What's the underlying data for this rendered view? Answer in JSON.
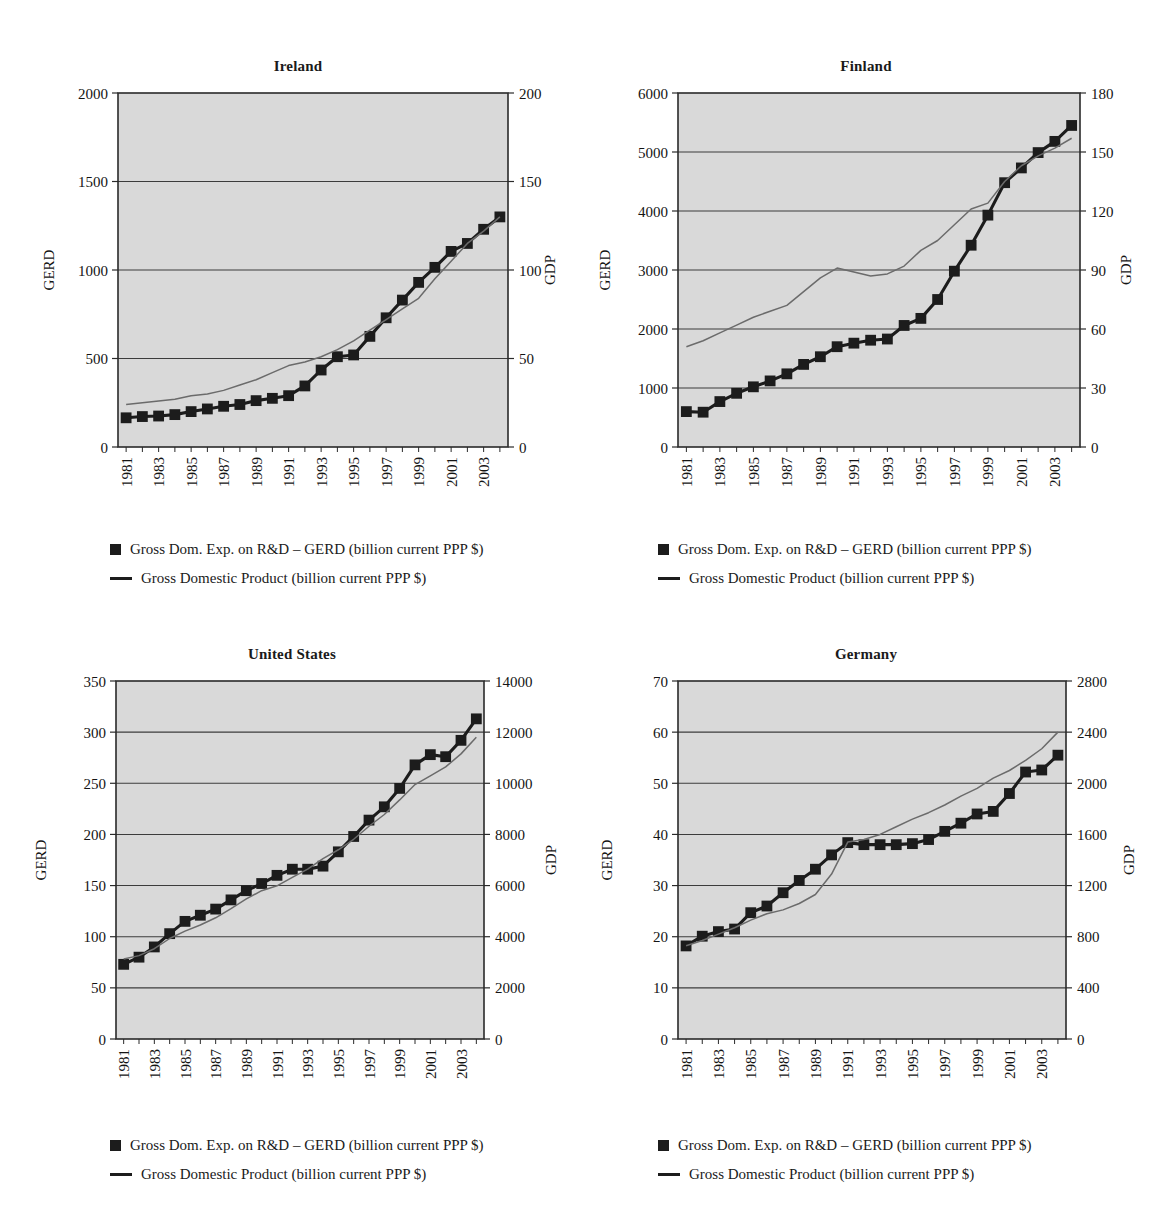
{
  "legend": {
    "gerd_label": "Gross Dom. Exp. on R&D – GERD (billion current PPP $)",
    "gdp_label": "Gross Domestic Product (billion current PPP $)",
    "gerd_marker_icon": "filled-square-marker",
    "gdp_line_icon": "solid-line-swatch"
  },
  "axis_titles": {
    "left": "GERD",
    "right": "GDP"
  },
  "colors": {
    "plot_background": "#d9d9d9",
    "gerd_series": "#1c1c1c",
    "gdp_series": "#6b6b6b",
    "gridline": "#3c3c3c",
    "axis": "#2a2a2a",
    "text": "#141414",
    "page_background": "#ffffff"
  },
  "chart_data": [
    {
      "id": "ireland",
      "type": "line",
      "title": "Ireland",
      "xlabel": "",
      "ylabel": "GERD",
      "y2label": "GDP",
      "grid": true,
      "legend_position": "below",
      "x": [
        1981,
        1982,
        1983,
        1984,
        1985,
        1986,
        1987,
        1988,
        1989,
        1990,
        1991,
        1992,
        1993,
        1994,
        1995,
        1996,
        1997,
        1998,
        1999,
        2000,
        2001,
        2002,
        2003,
        2004
      ],
      "xtick_labels": [
        "1981",
        "1983",
        "1985",
        "1987",
        "1989",
        "1991",
        "1993",
        "1995",
        "1997",
        "1999",
        "2001",
        "2003"
      ],
      "ylim": [
        0,
        2000
      ],
      "yticks": [
        0,
        500,
        1000,
        1500,
        2000
      ],
      "ytick_labels": [
        "0",
        "500",
        "1000",
        "1500",
        "2000"
      ],
      "y2lim": [
        0,
        200
      ],
      "y2ticks": [
        0,
        50,
        100,
        150,
        200
      ],
      "y2tick_labels": [
        "0",
        "50",
        "100",
        "150",
        "200"
      ],
      "series": [
        {
          "name": "Gross Dom. Exp. on R&D – GERD (billion current PPP $)",
          "axis": "left",
          "style": "marker-line",
          "values": [
            165,
            172,
            175,
            183,
            200,
            215,
            230,
            240,
            262,
            275,
            290,
            345,
            435,
            510,
            520,
            625,
            730,
            830,
            930,
            1015,
            1105,
            1150,
            1230,
            1300
          ]
        },
        {
          "name": "Gross Domestic Product (billion current PPP $)",
          "axis": "right",
          "style": "line",
          "values": [
            24,
            25,
            26,
            27,
            29,
            30,
            32,
            35,
            38,
            42,
            46,
            48,
            51,
            55,
            60,
            66,
            72,
            78,
            84,
            95,
            105,
            115,
            122,
            130
          ]
        }
      ]
    },
    {
      "id": "finland",
      "type": "line",
      "title": "Finland",
      "xlabel": "",
      "ylabel": "GERD",
      "y2label": "GDP",
      "grid": true,
      "legend_position": "below",
      "x": [
        1981,
        1982,
        1983,
        1984,
        1985,
        1986,
        1987,
        1988,
        1989,
        1990,
        1991,
        1992,
        1993,
        1994,
        1995,
        1996,
        1997,
        1998,
        1999,
        2000,
        2001,
        2002,
        2003,
        2004
      ],
      "xtick_labels": [
        "1981",
        "1983",
        "1985",
        "1987",
        "1989",
        "1991",
        "1993",
        "1995",
        "1997",
        "1999",
        "2001",
        "2003"
      ],
      "ylim": [
        0,
        6000
      ],
      "yticks": [
        0,
        1000,
        2000,
        3000,
        4000,
        5000,
        6000
      ],
      "ytick_labels": [
        "0",
        "1000",
        "2000",
        "3000",
        "4000",
        "5000",
        "6000"
      ],
      "y2lim": [
        0,
        180
      ],
      "y2ticks": [
        0,
        30,
        60,
        90,
        120,
        150,
        180
      ],
      "y2tick_labels": [
        "0",
        "30",
        "60",
        "90",
        "120",
        "150",
        "180"
      ],
      "series": [
        {
          "name": "Gross Dom. Exp. on R&D – GERD (billion current PPP $)",
          "axis": "left",
          "style": "marker-line",
          "values": [
            600,
            590,
            770,
            910,
            1020,
            1120,
            1240,
            1400,
            1530,
            1700,
            1760,
            1810,
            1830,
            2060,
            2180,
            2500,
            2980,
            3420,
            3930,
            4480,
            4730,
            4990,
            5180,
            5450
          ]
        },
        {
          "name": "Gross Domestic Product (billion current PPP $)",
          "axis": "right",
          "style": "line",
          "values": [
            51,
            54,
            58,
            62,
            66,
            69,
            72,
            79,
            86,
            91,
            89,
            87,
            88,
            92,
            100,
            105,
            113,
            121,
            124,
            135,
            143,
            148,
            152,
            157
          ]
        }
      ]
    },
    {
      "id": "united-states",
      "type": "line",
      "title": "United States",
      "xlabel": "",
      "ylabel": "GERD",
      "y2label": "GDP",
      "grid": true,
      "legend_position": "below",
      "x": [
        1981,
        1982,
        1983,
        1984,
        1985,
        1986,
        1987,
        1988,
        1989,
        1990,
        1991,
        1992,
        1993,
        1994,
        1995,
        1996,
        1997,
        1998,
        1999,
        2000,
        2001,
        2002,
        2003,
        2004
      ],
      "xtick_labels": [
        "1981",
        "1983",
        "1985",
        "1987",
        "1989",
        "1991",
        "1993",
        "1995",
        "1997",
        "1999",
        "2001",
        "2003"
      ],
      "ylim": [
        0,
        350
      ],
      "yticks": [
        0,
        50,
        100,
        150,
        200,
        250,
        300,
        350
      ],
      "ytick_labels": [
        "0",
        "50",
        "100",
        "150",
        "200",
        "250",
        "300",
        "350"
      ],
      "y2lim": [
        0,
        14000
      ],
      "y2ticks": [
        0,
        2000,
        4000,
        6000,
        8000,
        10000,
        12000,
        14000
      ],
      "y2tick_labels": [
        "0",
        "2000",
        "4000",
        "6000",
        "8000",
        "10000",
        "12000",
        "14000"
      ],
      "series": [
        {
          "name": "Gross Dom. Exp. on R&D – GERD (billion current PPP $)",
          "axis": "left",
          "style": "marker-line",
          "values": [
            73,
            80,
            90,
            103,
            115,
            121,
            127,
            136,
            145,
            152,
            160,
            166,
            166,
            169,
            183,
            198,
            214,
            227,
            245,
            268,
            278,
            276,
            292,
            313
          ]
        },
        {
          "name": "Gross Domestic Product (billion current PPP $)",
          "axis": "right",
          "style": "line",
          "values": [
            3130,
            3260,
            3530,
            3930,
            4220,
            4460,
            4740,
            5100,
            5480,
            5800,
            5990,
            6320,
            6640,
            7050,
            7400,
            7810,
            8320,
            8780,
            9350,
            9950,
            10290,
            10640,
            11150,
            11800
          ]
        }
      ]
    },
    {
      "id": "germany",
      "type": "line",
      "title": "Germany",
      "xlabel": "",
      "ylabel": "GERD",
      "y2label": "GDP",
      "grid": true,
      "legend_position": "below",
      "x": [
        1981,
        1982,
        1983,
        1984,
        1985,
        1986,
        1987,
        1988,
        1989,
        1990,
        1991,
        1992,
        1993,
        1994,
        1995,
        1996,
        1997,
        1998,
        1999,
        2000,
        2001,
        2002,
        2003,
        2004
      ],
      "xtick_labels": [
        "1981",
        "1983",
        "1985",
        "1987",
        "1989",
        "1991",
        "1993",
        "1995",
        "1997",
        "1999",
        "2001",
        "2003"
      ],
      "ylim": [
        0,
        70
      ],
      "yticks": [
        0,
        10,
        20,
        30,
        40,
        50,
        60,
        70
      ],
      "ytick_labels": [
        "0",
        "10",
        "20",
        "30",
        "40",
        "50",
        "60",
        "70"
      ],
      "y2lim": [
        0,
        2800
      ],
      "y2ticks": [
        0,
        400,
        800,
        1200,
        1600,
        2000,
        2400,
        2800
      ],
      "y2tick_labels": [
        "0",
        "400",
        "800",
        "1200",
        "1600",
        "2000",
        "2400",
        "2800"
      ],
      "series": [
        {
          "name": "Gross Dom. Exp. on R&D – GERD (billion current PPP $)",
          "axis": "left",
          "style": "marker-line",
          "values": [
            18.2,
            20.1,
            21.0,
            21.5,
            24.7,
            26.0,
            28.6,
            31.0,
            33.2,
            36.0,
            38.4,
            38.0,
            38.0,
            38.0,
            38.2,
            39.0,
            40.6,
            42.2,
            44.0,
            44.5,
            48.0,
            52.2,
            52.6,
            55.5
          ]
        },
        {
          "name": "Gross Domestic Product (billion current PPP $)",
          "axis": "right",
          "style": "line",
          "values": [
            730,
            770,
            820,
            870,
            930,
            980,
            1010,
            1060,
            1130,
            1290,
            1540,
            1560,
            1600,
            1660,
            1720,
            1770,
            1830,
            1900,
            1960,
            2040,
            2100,
            2180,
            2270,
            2400
          ]
        }
      ]
    }
  ],
  "panels": [
    {
      "id": "ireland",
      "title": "Ireland"
    },
    {
      "id": "finland",
      "title": "Finland"
    },
    {
      "id": "united-states",
      "title": "United States"
    },
    {
      "id": "germany",
      "title": "Germany"
    }
  ]
}
